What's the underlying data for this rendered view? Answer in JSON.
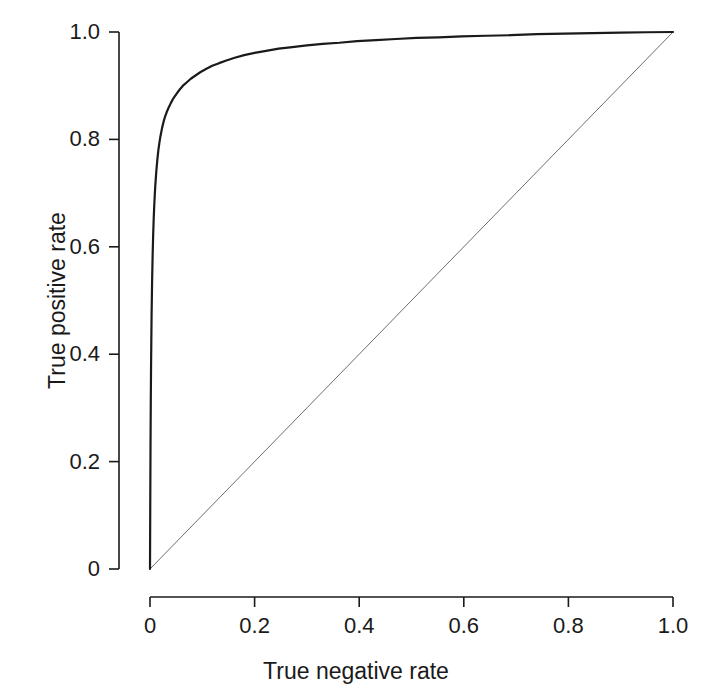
{
  "chart_data": {
    "type": "line",
    "title": "",
    "xlabel": "True negative rate",
    "ylabel": "True positive rate",
    "xlim": [
      0,
      1
    ],
    "ylim": [
      0,
      1
    ],
    "grid": false,
    "legend": "none",
    "xticks": [
      "0",
      "0.2",
      "0.4",
      "0.6",
      "0.8",
      "1.0"
    ],
    "xtick_values": [
      0,
      0.2,
      0.4,
      0.6,
      0.8,
      1.0
    ],
    "yticks": [
      "0",
      "0.2",
      "0.4",
      "0.6",
      "0.8",
      "1.0"
    ],
    "ytick_values": [
      0,
      0.2,
      0.4,
      0.6,
      0.8,
      1.0
    ],
    "series": [
      {
        "name": "ROC curve",
        "color": "#1a1a1a",
        "linewidth": 2.2,
        "x": [
          0.0,
          0.0005,
          0.001,
          0.0015,
          0.002,
          0.003,
          0.004,
          0.005,
          0.006,
          0.007,
          0.008,
          0.009,
          0.01,
          0.012,
          0.014,
          0.016,
          0.018,
          0.02,
          0.023,
          0.026,
          0.029,
          0.032,
          0.036,
          0.04,
          0.045,
          0.05,
          0.056,
          0.063,
          0.07,
          0.078,
          0.087,
          0.096,
          0.107,
          0.119,
          0.132,
          0.146,
          0.162,
          0.18,
          0.2,
          0.222,
          0.246,
          0.272,
          0.3,
          0.33,
          0.362,
          0.396,
          0.432,
          0.47,
          0.51,
          0.552,
          0.596,
          0.642,
          0.69,
          0.74,
          0.792,
          0.846,
          0.9,
          0.95,
          1.0
        ],
        "y": [
          0.0,
          0.12,
          0.23,
          0.31,
          0.375,
          0.47,
          0.535,
          0.583,
          0.62,
          0.65,
          0.674,
          0.694,
          0.712,
          0.74,
          0.762,
          0.78,
          0.794,
          0.806,
          0.821,
          0.833,
          0.843,
          0.851,
          0.86,
          0.868,
          0.877,
          0.884,
          0.892,
          0.9,
          0.906,
          0.913,
          0.919,
          0.925,
          0.931,
          0.937,
          0.942,
          0.947,
          0.952,
          0.957,
          0.961,
          0.965,
          0.969,
          0.972,
          0.975,
          0.978,
          0.98,
          0.983,
          0.985,
          0.987,
          0.989,
          0.99,
          0.992,
          0.993,
          0.994,
          0.996,
          0.997,
          0.998,
          0.999,
          0.9995,
          1.0
        ]
      },
      {
        "name": "Chance diagonal",
        "color": "#6e6e6e",
        "linewidth": 1.0,
        "x": [
          0.0,
          1.0
        ],
        "y": [
          0.0,
          1.0
        ]
      }
    ]
  },
  "axes": {
    "x_title": "True negative rate",
    "y_title": "True positive rate",
    "axis_color": "#1a1a1a"
  }
}
